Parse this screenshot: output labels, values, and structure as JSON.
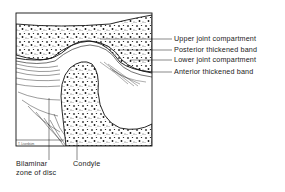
{
  "diagram": {
    "colors": {
      "ink": "#1a1a1a",
      "background": "#ffffff",
      "label_text": "#222222"
    },
    "right_labels": [
      {
        "text": "Upper joint compartment",
        "y": 39
      },
      {
        "text": "Posterior thickened band",
        "y": 50
      },
      {
        "text": "Lower joint compartment",
        "y": 60
      },
      {
        "text": "Anterior thickened band",
        "y": 72
      }
    ],
    "bottom_labels": {
      "bilaminar": {
        "line1": "Bilaminar",
        "line2": "zone of disc"
      },
      "condyle": "Condyle"
    },
    "signature": "T. Lisenbüm"
  }
}
